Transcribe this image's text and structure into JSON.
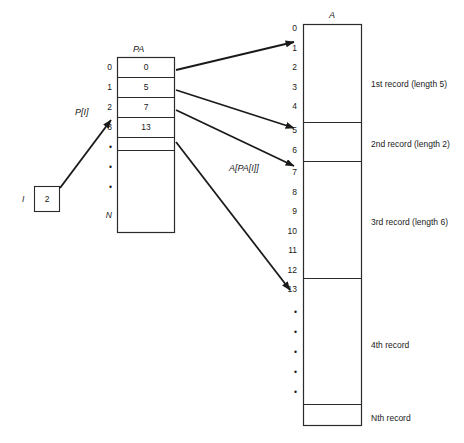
{
  "figure": {
    "title_pa": "PA",
    "title_a": "A",
    "var_i_label": "I",
    "var_i_value": "2",
    "pointer_label": "P[I]",
    "deref_label": "A[PA[I]]",
    "ellipsis_dot": "•"
  },
  "pa_array": {
    "name": "PA",
    "indices": [
      "0",
      "1",
      "2",
      "3"
    ],
    "values": [
      "0",
      "5",
      "7",
      "13"
    ],
    "ellipsis_count": 3,
    "last_index": "N"
  },
  "a_array": {
    "name": "A",
    "indices": [
      "0",
      "1",
      "2",
      "3",
      "4",
      "5",
      "6",
      "7",
      "8",
      "9",
      "10",
      "11",
      "12",
      "13"
    ],
    "ellipsis_count": 5,
    "records": [
      {
        "label": "1st record (length 5)",
        "start": "0",
        "length": "5"
      },
      {
        "label": "2nd record (length 2)",
        "start": "5",
        "length": "2"
      },
      {
        "label": "3rd record (length 6)",
        "start": "7",
        "length": "6"
      },
      {
        "label": "4th record",
        "start": "13",
        "length": ""
      },
      {
        "label": "Nth record",
        "start": "",
        "length": ""
      }
    ]
  },
  "colors": {
    "ink": "#1a1a1a",
    "line": "#2b2b2b",
    "background": "#ffffff"
  }
}
